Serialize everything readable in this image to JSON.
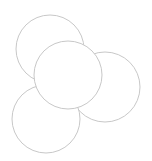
{
  "diagram": {
    "type": "overlapping-circles",
    "stroke_color": "#c8c8c8",
    "fill_color": "#ffffff",
    "circles": [
      {
        "id": "top-left",
        "cx": 50,
        "cy": 49,
        "r": 34
      },
      {
        "id": "right",
        "cx": 105,
        "cy": 87,
        "r": 35
      },
      {
        "id": "bottom-left",
        "cx": 46,
        "cy": 119,
        "r": 34
      },
      {
        "id": "center",
        "cx": 68,
        "cy": 75,
        "r": 34
      }
    ]
  }
}
